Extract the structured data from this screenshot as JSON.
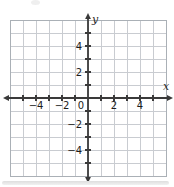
{
  "figure": {
    "background": "#ffffff",
    "shadow_color_top": "#dedede",
    "shadow_color_bottom": "#f1f1f1"
  },
  "chart_data": {
    "type": "scatter",
    "title": "",
    "xlabel": "x",
    "ylabel": "y",
    "xlim": [
      -6,
      6
    ],
    "ylim": [
      -6,
      6
    ],
    "grid": true,
    "tick_interval": 1,
    "label_interval": 2,
    "origin_label": "0",
    "x_tick_labels": [
      {
        "value": -4,
        "label": "−4"
      },
      {
        "value": -2,
        "label": "−2"
      },
      {
        "value": 2,
        "label": "2"
      },
      {
        "value": 4,
        "label": "4"
      }
    ],
    "y_tick_labels": [
      {
        "value": 4,
        "label": "4"
      },
      {
        "value": 2,
        "label": "2"
      },
      {
        "value": -2,
        "label": "−2"
      },
      {
        "value": -4,
        "label": "−4"
      }
    ],
    "series": [],
    "legend": null,
    "colors": {
      "gridline": "#c9ccd1",
      "grid_border": "#aab0b6",
      "axis": "#3a3a3a",
      "tick_label": "#1c1c1c",
      "axis_letter": "#2a2a2a"
    }
  }
}
